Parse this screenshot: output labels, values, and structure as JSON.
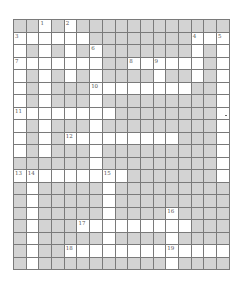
{
  "puzzle": {
    "type": "crossword",
    "cols": 17,
    "rows": 20,
    "colors": {
      "block": "#d3d3d3",
      "open": "#ffffff",
      "gridline": "#7a7a7a"
    },
    "layout": [
      "##W#W############",
      "WWWWWW########WWW",
      "W#W#W#W#######W#W",
      "WWWWWWW##WWWWWW#W",
      "W#W#W#W####W##W#W",
      "W#W###WWWWWWWW##W",
      "W#W###W#########W",
      "WWWWWWWW########W",
      "W#W###W#########W",
      "W#W#WWWWWWWWW###W",
      "W#W###W#########W",
      "######W#########W",
      "WWWWWWWWW#######W",
      "#W#####W#########",
      "#W#####W#########",
      "#W#####W####W####",
      "#W###WWWWWWWWW###",
      "#W#####W####W####",
      "#W##WWWWWWWWWWWWW",
      "#W##########W####"
    ],
    "numbers": [
      {
        "n": "1",
        "row": 0,
        "col": 2
      },
      {
        "n": "2",
        "row": 0,
        "col": 4
      },
      {
        "n": "3",
        "row": 1,
        "col": 0
      },
      {
        "n": "4",
        "row": 1,
        "col": 14
      },
      {
        "n": "5",
        "row": 1,
        "col": 16
      },
      {
        "n": "6",
        "row": 2,
        "col": 6
      },
      {
        "n": "7",
        "row": 3,
        "col": 0
      },
      {
        "n": "8",
        "row": 3,
        "col": 9
      },
      {
        "n": "9",
        "row": 3,
        "col": 11
      },
      {
        "n": "10",
        "row": 5,
        "col": 6
      },
      {
        "n": "11",
        "row": 7,
        "col": 0
      },
      {
        "n": "12",
        "row": 9,
        "col": 4
      },
      {
        "n": "13",
        "row": 12,
        "col": 0
      },
      {
        "n": "14",
        "row": 12,
        "col": 1
      },
      {
        "n": "15",
        "row": 12,
        "col": 7
      },
      {
        "n": "16",
        "row": 15,
        "col": 12
      },
      {
        "n": "17",
        "row": 16,
        "col": 5
      },
      {
        "n": "18",
        "row": 18,
        "col": 4
      },
      {
        "n": "19",
        "row": 18,
        "col": 12
      }
    ],
    "marks": [
      {
        "row": 7,
        "col": 16,
        "symbol": "dot"
      }
    ]
  }
}
